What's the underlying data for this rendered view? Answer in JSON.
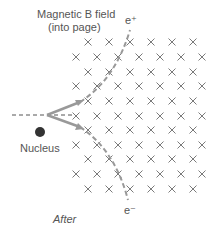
{
  "diagram": {
    "field_label_line1": "Magnetic B field",
    "field_label_line2": "(into page)",
    "positron_label": "e⁺",
    "electron_label": "e⁻",
    "nucleus_label": "Nucleus",
    "caption": "After",
    "field_symbol": "×",
    "colors": {
      "text": "#555555",
      "field_marks": "#777777",
      "tracks": "#999999",
      "nucleus": "#333333"
    }
  }
}
